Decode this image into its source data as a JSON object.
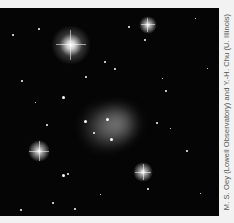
{
  "image": {
    "subject": "star-field-with-nebula",
    "background_color": "#050505",
    "caption": "M. S. Oey (Lowell Observatory) and Y.-H. Chu (U. Illinois)"
  }
}
